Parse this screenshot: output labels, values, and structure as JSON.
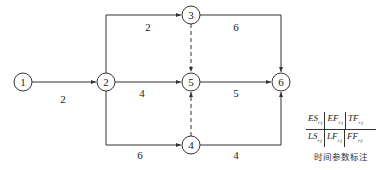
{
  "diagram": {
    "type": "double-code network diagram",
    "nodes": [
      {
        "id": "1",
        "label": "1",
        "x": 23,
        "y": 82
      },
      {
        "id": "2",
        "label": "2",
        "x": 106,
        "y": 82
      },
      {
        "id": "3",
        "label": "3",
        "x": 191,
        "y": 15
      },
      {
        "id": "4",
        "label": "4",
        "x": 191,
        "y": 145
      },
      {
        "id": "5",
        "label": "5",
        "x": 191,
        "y": 82
      },
      {
        "id": "6",
        "label": "6",
        "x": 281,
        "y": 82
      }
    ],
    "edges": [
      {
        "from": "1",
        "to": "2",
        "duration": "2",
        "dummy": false
      },
      {
        "from": "2",
        "to": "3",
        "duration": "2",
        "dummy": false
      },
      {
        "from": "2",
        "to": "5",
        "duration": "4",
        "dummy": false
      },
      {
        "from": "2",
        "to": "4",
        "duration": "6",
        "dummy": false
      },
      {
        "from": "3",
        "to": "6",
        "duration": "6",
        "dummy": false
      },
      {
        "from": "5",
        "to": "6",
        "duration": "5",
        "dummy": false
      },
      {
        "from": "4",
        "to": "6",
        "duration": "4",
        "dummy": false
      },
      {
        "from": "3",
        "to": "5",
        "duration": "",
        "dummy": true
      },
      {
        "from": "4",
        "to": "5",
        "duration": "",
        "dummy": true
      }
    ]
  },
  "labels": {
    "n1": "1",
    "n2": "2",
    "n3": "3",
    "n4": "4",
    "n5": "5",
    "n6": "6",
    "e12": "2",
    "e23": "2",
    "e25": "4",
    "e24": "6",
    "e36": "6",
    "e56": "5",
    "e46": "4"
  },
  "legend": {
    "top": [
      {
        "main": "ES",
        "sub": "i-j"
      },
      {
        "main": "EF",
        "sub": "i-j"
      },
      {
        "main": "TF",
        "sub": "i-j"
      }
    ],
    "bottom": [
      {
        "main": "LS",
        "sub": "i-j"
      },
      {
        "main": "LF",
        "sub": "i-j"
      },
      {
        "main": "FF",
        "sub": "i-j"
      }
    ],
    "caption": "时间参数标注"
  }
}
